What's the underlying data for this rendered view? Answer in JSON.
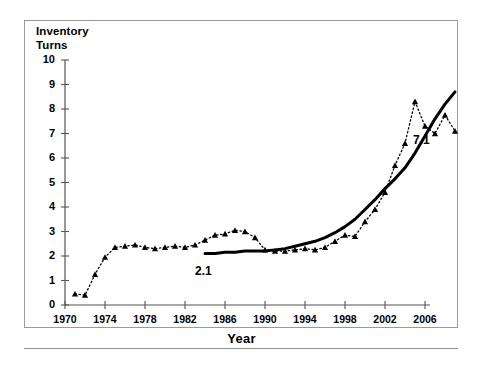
{
  "chart_data": {
    "type": "line",
    "title": "",
    "ylabel": "Inventory Turns",
    "ylabel_lines": [
      "Inventory",
      "Turns"
    ],
    "xlabel": "Year",
    "xlim": [
      1970,
      2006
    ],
    "ylim": [
      0,
      10
    ],
    "xticks": [
      1970,
      1974,
      1978,
      1982,
      1986,
      1990,
      1994,
      1998,
      2002,
      2006
    ],
    "yticks": [
      0,
      1,
      2,
      3,
      4,
      5,
      6,
      7,
      8,
      9,
      10
    ],
    "grid": false,
    "legend": "none",
    "series": [
      {
        "name": "dotted-markers",
        "style": "dotted",
        "marker": "triangle",
        "color": "#000000",
        "points": [
          [
            1971,
            0.45
          ],
          [
            1972,
            0.4
          ],
          [
            1973,
            1.25
          ],
          [
            1974,
            1.95
          ],
          [
            1975,
            2.35
          ],
          [
            1976,
            2.4
          ],
          [
            1977,
            2.45
          ],
          [
            1978,
            2.35
          ],
          [
            1979,
            2.3
          ],
          [
            1980,
            2.35
          ],
          [
            1981,
            2.4
          ],
          [
            1982,
            2.35
          ],
          [
            1983,
            2.45
          ],
          [
            1984,
            2.65
          ],
          [
            1985,
            2.85
          ],
          [
            1986,
            2.9
          ],
          [
            1987,
            3.05
          ],
          [
            1988,
            3.0
          ],
          [
            1989,
            2.75
          ],
          [
            1990,
            2.25
          ],
          [
            1991,
            2.2
          ],
          [
            1992,
            2.2
          ],
          [
            1993,
            2.25
          ],
          [
            1994,
            2.3
          ],
          [
            1995,
            2.25
          ],
          [
            1996,
            2.35
          ],
          [
            1997,
            2.6
          ],
          [
            1998,
            2.85
          ],
          [
            1999,
            2.8
          ],
          [
            2000,
            3.4
          ],
          [
            2001,
            3.9
          ],
          [
            2002,
            4.6
          ],
          [
            2003,
            5.7
          ],
          [
            2004,
            6.6
          ],
          [
            2005,
            8.3
          ],
          [
            2006,
            7.3
          ],
          [
            2007,
            7.0
          ],
          [
            2008,
            7.75
          ],
          [
            2009,
            7.1
          ]
        ]
      },
      {
        "name": "solid-trend",
        "style": "solid",
        "marker": "none",
        "color": "#000000",
        "points": [
          [
            1984,
            2.1
          ],
          [
            1985,
            2.1
          ],
          [
            1986,
            2.15
          ],
          [
            1987,
            2.15
          ],
          [
            1988,
            2.2
          ],
          [
            1989,
            2.2
          ],
          [
            1990,
            2.2
          ],
          [
            1991,
            2.25
          ],
          [
            1992,
            2.3
          ],
          [
            1993,
            2.4
          ],
          [
            1994,
            2.5
          ],
          [
            1995,
            2.6
          ],
          [
            1996,
            2.75
          ],
          [
            1997,
            2.95
          ],
          [
            1998,
            3.2
          ],
          [
            1999,
            3.5
          ],
          [
            2000,
            3.9
          ],
          [
            2001,
            4.3
          ],
          [
            2002,
            4.75
          ],
          [
            2003,
            5.15
          ],
          [
            2004,
            5.6
          ],
          [
            2005,
            6.2
          ],
          [
            2006,
            6.9
          ],
          [
            2007,
            7.6
          ],
          [
            2008,
            8.2
          ],
          [
            2009,
            8.7
          ]
        ]
      }
    ],
    "annotations": [
      {
        "text": "2.1",
        "x": 1984,
        "y": 2.1
      },
      {
        "text": "7.1",
        "x": 2004,
        "y": 7.1
      }
    ]
  }
}
